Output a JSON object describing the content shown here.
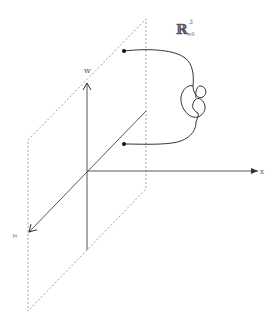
{
  "diagram": {
    "title_label": {
      "symbol": "ℝ",
      "superscript": "3",
      "subscript": "≥0"
    },
    "axes": {
      "w": {
        "label": "w",
        "direction": "up"
      },
      "x": {
        "label": "x",
        "direction": "right"
      },
      "z": {
        "label": "z",
        "direction": "down-left"
      }
    },
    "plane": {
      "style": "dashed",
      "orientation": "wz-plane"
    },
    "knotted_arc": {
      "description": "knotted arc with two endpoints on the plane",
      "endpoints": 2,
      "knot_type": "trefoil-like knot"
    },
    "colors": {
      "axis": "#333333",
      "plane": "#777777",
      "curve": "#333333",
      "label": "#555555"
    }
  }
}
